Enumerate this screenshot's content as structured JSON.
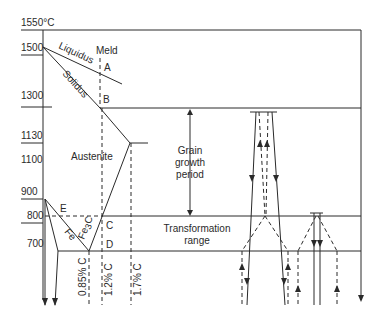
{
  "diagram": {
    "y_axis": {
      "unit_label": "1550°C",
      "ticks": [
        "1500",
        "1300",
        "1130",
        "1100",
        "900",
        "800",
        "700"
      ]
    },
    "curves": {
      "liquidus": "Liquidus",
      "solidus": "Solidus",
      "fe": "Fe",
      "fe3c_main": "Fe",
      "fe3c_sub": "3",
      "fe3c_end": "C"
    },
    "points": {
      "meld": "Meld",
      "a": "A",
      "b": "B",
      "c": "C",
      "d": "D",
      "e": "E"
    },
    "regions": {
      "austenite": "Austenite",
      "grain_growth": [
        "Grain",
        "growth",
        "period"
      ],
      "transformation": [
        "Transformation",
        "range"
      ]
    },
    "composition_lines": {
      "c085": "0.85% C",
      "c12": "1.2% C",
      "c17": "1.7% C"
    },
    "colors": {
      "line": "#2a2a2a",
      "background": "#ffffff"
    }
  }
}
